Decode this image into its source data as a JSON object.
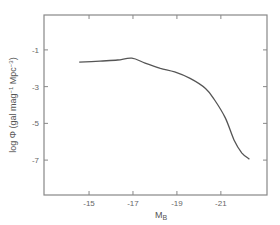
{
  "chart_data": {
    "type": "line",
    "title": "",
    "xlabel": "M_B",
    "xlabel_main": "M",
    "xlabel_sub": "B",
    "ylabel": "log Φ (gal mag⁻¹ Mpc⁻³)",
    "ylabel_parts": {
      "prefix": "log Φ  (gal mag",
      "sup1": "−1",
      "mid": " Mpc",
      "sup2": "−3",
      "suffix": ")"
    },
    "xlim": [
      -12.95,
      -23.1
    ],
    "ylim": [
      -8.9,
      0.9
    ],
    "x_ticks": [
      -15,
      -17,
      -19,
      -21
    ],
    "x_tick_labels": [
      "-15",
      "-17",
      "-19",
      "-21"
    ],
    "y_ticks": [
      -1,
      -3,
      -5,
      -7
    ],
    "y_tick_labels": [
      "-1",
      "-3",
      "-5",
      "-7"
    ],
    "grid": false,
    "legend": null,
    "series": [
      {
        "name": "luminosity function",
        "x": [
          -14.55,
          -15.5,
          -16.3,
          -16.95,
          -17.55,
          -18.25,
          -18.9,
          -19.6,
          -20.3,
          -20.7,
          -21.2,
          -21.6,
          -21.95,
          -22.3
        ],
        "y": [
          -1.67,
          -1.61,
          -1.55,
          -1.45,
          -1.72,
          -2.0,
          -2.2,
          -2.55,
          -3.1,
          -3.7,
          -4.7,
          -5.9,
          -6.6,
          -6.95
        ]
      }
    ]
  }
}
